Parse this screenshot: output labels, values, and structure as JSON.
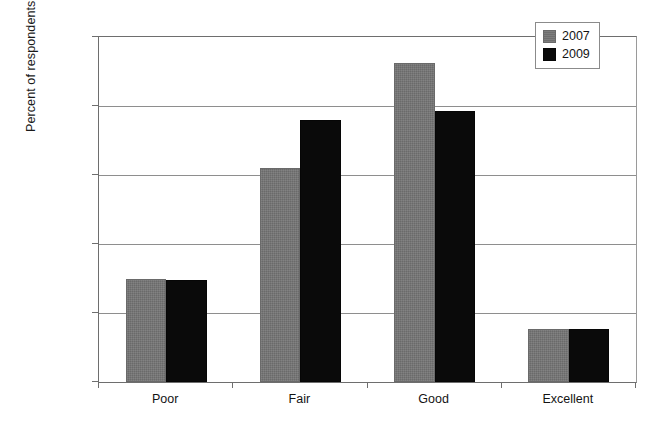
{
  "chart_data": {
    "type": "bar",
    "title": "",
    "xlabel": "",
    "ylabel": "Percent of respondents",
    "categories": [
      "Poor",
      "Fair",
      "Good",
      "Excellent"
    ],
    "series": [
      {
        "name": "2007",
        "color": "#757575",
        "values": [
          14.9,
          31.0,
          46.2,
          7.7
        ]
      },
      {
        "name": "2009",
        "color": "#0a0a0a",
        "values": [
          14.8,
          38.0,
          39.3,
          7.7
        ]
      }
    ],
    "ylim": [
      0,
      50
    ],
    "ytick_values": [
      0,
      10,
      20,
      30,
      40,
      50
    ],
    "ytick_labels": [
      "0%",
      "10%",
      "20%",
      "30%",
      "40%",
      "50%"
    ],
    "grid": true,
    "grid_axis": "y",
    "legend_position": "top-right",
    "bar_style": "grouped"
  },
  "axes": {
    "y_title": "Percent of respondents"
  },
  "legend": {
    "entries": [
      {
        "label": "2007"
      },
      {
        "label": "2009"
      }
    ]
  }
}
